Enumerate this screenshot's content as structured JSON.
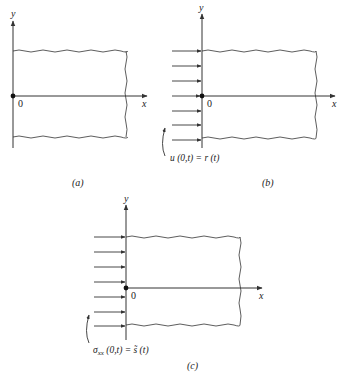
{
  "panels": [
    {
      "id": "a",
      "caption": "(a)",
      "y_label": "y",
      "x_label": "x",
      "origin_label": "0",
      "boundary_arrows": false
    },
    {
      "id": "b",
      "caption": "(b)",
      "y_label": "y",
      "x_label": "x",
      "origin_label": "0",
      "boundary_arrows": true,
      "arrow_count": 7,
      "boundary_condition": "u (0,t) = r (t)"
    },
    {
      "id": "c",
      "caption": "(c)",
      "y_label": "y",
      "x_label": "x",
      "origin_label": "0",
      "boundary_arrows": true,
      "arrow_count": 7,
      "boundary_condition_symbol": "σ",
      "boundary_condition_subscript": "xx",
      "boundary_condition_rest": " (0,t) = s̃ (t)"
    }
  ],
  "colors": {
    "line": "#333333",
    "background": "#ffffff"
  }
}
